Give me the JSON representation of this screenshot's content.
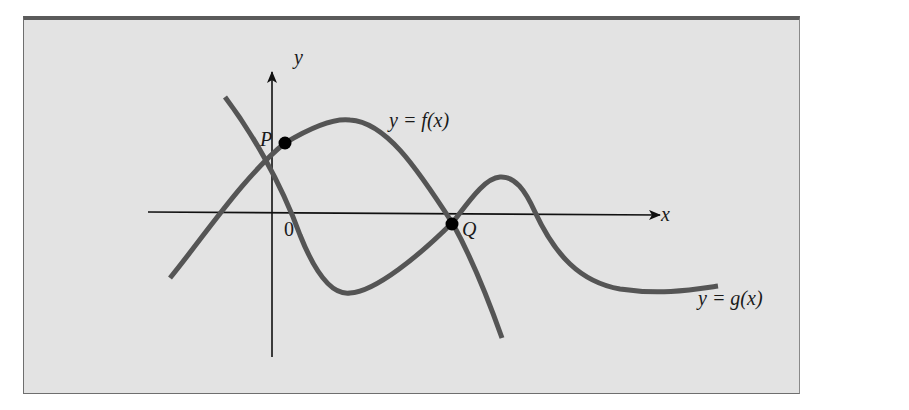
{
  "figure": {
    "axes": {
      "x_label": "x",
      "y_label": "y",
      "origin_label": "0"
    },
    "curves": [
      {
        "name": "f",
        "label": "y = f(x)",
        "color": "#555555"
      },
      {
        "name": "g",
        "label": "y = g(x)",
        "color": "#555555"
      }
    ],
    "points": [
      {
        "name": "P",
        "label": "P",
        "description": "intersection of f and g left of y-axis"
      },
      {
        "name": "Q",
        "label": "Q",
        "description": "intersection of f and g on x-axis"
      }
    ],
    "colors": {
      "background": "#e3e3e3",
      "frame_top": "#5b5b5b",
      "axis": "#111111",
      "curve": "#555555",
      "point": "#000000"
    }
  }
}
